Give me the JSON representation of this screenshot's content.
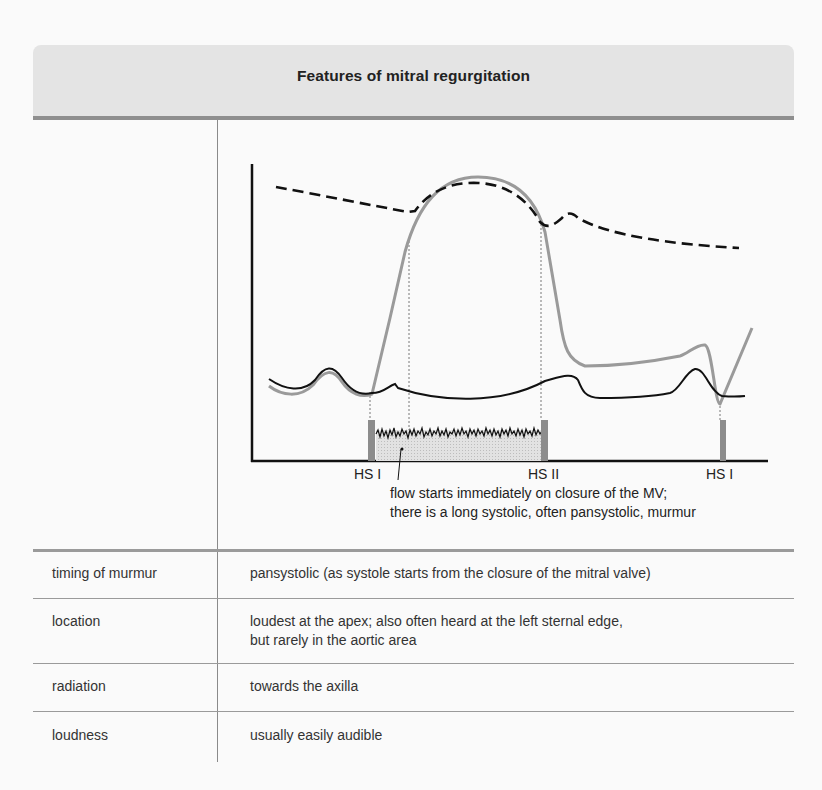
{
  "title": "Features of mitral regurgitation",
  "diagram": {
    "tick_labels": [
      {
        "id": "hs1_start",
        "label": "HS I"
      },
      {
        "id": "hs2",
        "label": "HS II"
      },
      {
        "id": "hs1_end",
        "label": "HS I"
      }
    ],
    "caption_lines": [
      "flow starts immediately on closure of the MV;",
      "there is a long systolic, often pansystolic, murmur"
    ],
    "curves": [
      {
        "name": "left-ventricular-pressure",
        "style": "solid grey"
      },
      {
        "name": "aortic-pressure",
        "style": "dashed black"
      },
      {
        "name": "left-atrial-pressure",
        "style": "solid black"
      }
    ],
    "colors": {
      "header_bg": "#e4e4e4",
      "header_rule": "#8f8f8f",
      "lv_curve": "#9a9a9a",
      "aortic_curve": "#111111",
      "atrial_curve": "#111111",
      "heart_sound_bar": "#8c8c8c",
      "murmur_fill": "#d6d6d6"
    }
  },
  "rows": [
    {
      "label": "timing of murmur",
      "value_lines": [
        "pansystolic (as systole starts from the closure of the mitral valve)"
      ]
    },
    {
      "label": "location",
      "value_lines": [
        "loudest at the apex; also often heard at the left sternal edge,",
        "but rarely in the aortic area"
      ]
    },
    {
      "label": "radiation",
      "value_lines": [
        "towards the axilla"
      ]
    },
    {
      "label": "loudness",
      "value_lines": [
        "usually easily audible"
      ]
    }
  ]
}
